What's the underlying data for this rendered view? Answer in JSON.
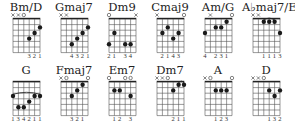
{
  "chords": [
    {
      "name": "Bm/D",
      "markers": [
        "x",
        "x",
        "o",
        "",
        "",
        ""
      ],
      "dots": [
        [
          4,
          4
        ],
        [
          5,
          3
        ],
        [
          6,
          2
        ]
      ],
      "barre": null,
      "fingering": [
        "",
        "",
        "",
        "3",
        "2",
        "1"
      ]
    },
    {
      "name": "Gmaj7",
      "markers": [
        "x",
        "x",
        "",
        "",
        "",
        ""
      ],
      "dots": [
        [
          3,
          5
        ],
        [
          4,
          4
        ],
        [
          5,
          3
        ],
        [
          6,
          2
        ]
      ],
      "barre": null,
      "fingering": [
        "",
        "",
        "4",
        "3",
        "2",
        "1"
      ]
    },
    {
      "name": "Dm9",
      "markers": [
        "o",
        "",
        "",
        "",
        "",
        "x"
      ],
      "dots": [
        [
          1,
          5
        ],
        [
          2,
          3
        ],
        [
          4,
          5
        ],
        [
          5,
          5
        ]
      ],
      "barre": null,
      "fingering": [
        "2",
        "1",
        "",
        "3",
        "4",
        ""
      ]
    },
    {
      "name": "Cmaj9",
      "markers": [
        "x",
        "",
        "",
        "",
        "",
        "o"
      ],
      "dots": [
        [
          2,
          3
        ],
        [
          3,
          2
        ],
        [
          4,
          4
        ],
        [
          5,
          3
        ]
      ],
      "barre": null,
      "fingering": [
        "",
        "2",
        "1",
        "4",
        "3",
        ""
      ]
    },
    {
      "name": "Am/G",
      "markers": [
        "",
        "x",
        "",
        "",
        "",
        "o"
      ],
      "dots": [
        [
          1,
          3
        ],
        [
          3,
          2
        ],
        [
          4,
          2
        ],
        [
          5,
          1
        ]
      ],
      "barre": null,
      "fingering": [
        "4",
        "",
        "2",
        "3",
        "1",
        ""
      ]
    },
    {
      "name": "A♭maj7/E♭",
      "markers": [
        "x",
        "x",
        "",
        "",
        "",
        ""
      ],
      "dots": [
        [
          3,
          1
        ],
        [
          4,
          1
        ],
        [
          5,
          1
        ],
        [
          6,
          3
        ]
      ],
      "barre": {
        "fret": 1,
        "from": 3,
        "to": 5
      },
      "fingering": [
        "",
        "",
        "1",
        "1",
        "1",
        "3"
      ]
    },
    {
      "name": "G",
      "markers": [
        "",
        "",
        "",
        "",
        "",
        ""
      ],
      "dots": [
        [
          1,
          3
        ],
        [
          2,
          5
        ],
        [
          3,
          5
        ],
        [
          4,
          4
        ],
        [
          5,
          3
        ],
        [
          6,
          3
        ]
      ],
      "barre": {
        "fret": 3,
        "from": 1,
        "to": 6
      },
      "fingering": [
        "1",
        "3",
        "4",
        "2",
        "1",
        "1"
      ]
    },
    {
      "name": "Fmaj7",
      "markers": [
        "x",
        "o",
        "",
        "",
        "",
        "o"
      ],
      "dots": [
        [
          3,
          3
        ],
        [
          4,
          2
        ],
        [
          5,
          1
        ]
      ],
      "barre": null,
      "fingering": [
        "",
        "",
        "3",
        "2",
        "1",
        ""
      ]
    },
    {
      "name": "Em7",
      "markers": [
        "o",
        "",
        "",
        "o",
        "o",
        ""
      ],
      "dots": [
        [
          2,
          2
        ],
        [
          3,
          2
        ],
        [
          5,
          3
        ]
      ],
      "barre": null,
      "fingering": [
        "",
        "1",
        "2",
        "",
        "3",
        ""
      ]
    },
    {
      "name": "Dm7",
      "markers": [
        "x",
        "x",
        "o",
        "",
        "",
        ""
      ],
      "dots": [
        [
          4,
          2
        ],
        [
          5,
          1
        ],
        [
          6,
          1
        ]
      ],
      "barre": {
        "fret": 1,
        "from": 5,
        "to": 6
      },
      "fingering": [
        "",
        "",
        "",
        "2",
        "1",
        "1"
      ]
    },
    {
      "name": "A",
      "markers": [
        "x",
        "o",
        "",
        "",
        "",
        "o"
      ],
      "dots": [
        [
          3,
          2
        ],
        [
          4,
          2
        ],
        [
          5,
          2
        ]
      ],
      "barre": null,
      "fingering": [
        "",
        "",
        "1",
        "2",
        "3",
        ""
      ]
    },
    {
      "name": "D",
      "markers": [
        "x",
        "x",
        "o",
        "",
        "",
        ""
      ],
      "dots": [
        [
          4,
          2
        ],
        [
          5,
          3
        ],
        [
          6,
          2
        ]
      ],
      "barre": null,
      "fingering": [
        "",
        "",
        "",
        "1",
        "3",
        "2"
      ]
    }
  ],
  "layout": {
    "positions": [
      [
        2,
        0
      ],
      [
        50,
        0
      ],
      [
        98,
        0
      ],
      [
        146,
        0
      ],
      [
        194,
        0
      ],
      [
        242,
        0
      ],
      [
        2,
        63
      ],
      [
        50,
        63
      ],
      [
        98,
        63
      ],
      [
        146,
        63
      ],
      [
        194,
        63
      ],
      [
        242,
        63
      ]
    ]
  }
}
